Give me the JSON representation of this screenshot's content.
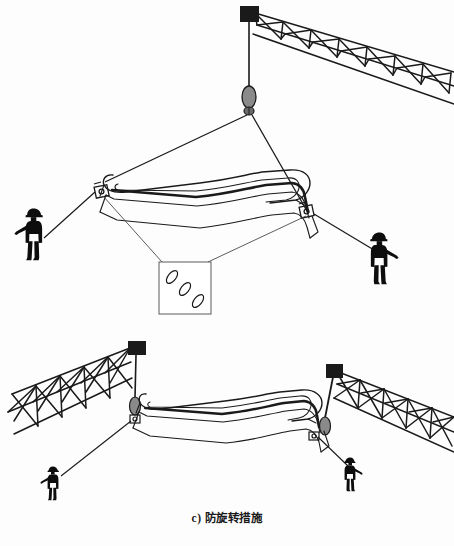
{
  "figure": {
    "caption_label": "c)",
    "caption_text": "防旋转措施",
    "background_color": "#fdfdfd",
    "ink_color": "#1a1a1a",
    "hookblock_color": "#8a8a8a",
    "panel_count": 2
  },
  "panel_top": {
    "name": "single-crane-lift-with-taglines",
    "boom": {
      "label": "lattice-boom",
      "tip_block": "boom-tip-block",
      "chord_count": 3,
      "panel_bays": 7
    },
    "hoist": {
      "rope": "hoist-rope",
      "hook_block": "hook-block",
      "swivel": "anti-rotation-swivel"
    },
    "slings": {
      "left_leg": "sling-leg-left",
      "right_leg": "sling-leg-right"
    },
    "load": {
      "label": "curved-box-girder",
      "shackle_left": "shackle-left",
      "shackle_right": "shackle-right"
    },
    "taglines": {
      "left": "tagline-left",
      "right": "tagline-right"
    },
    "workers": [
      {
        "id": "worker-left",
        "label": "rigger-holding-tagline"
      },
      {
        "id": "worker-right",
        "label": "rigger-holding-tagline"
      }
    ],
    "detail_callout": {
      "label": "chain-detail-callout",
      "link_count": 3,
      "content": "anti-rotation chain links"
    }
  },
  "panel_bottom": {
    "name": "tandem-crane-lift-with-taglines",
    "boom_left": {
      "label": "lattice-boom-left",
      "tip_block": "boom-tip-block-left",
      "panel_bays": 5
    },
    "boom_right": {
      "label": "lattice-boom-right",
      "tip_block": "boom-tip-block-right",
      "panel_bays": 5
    },
    "hoist_left": {
      "rope": "hoist-rope-left",
      "hook_block": "hook-block-left",
      "swivel": "anti-rotation-swivel-left"
    },
    "hoist_right": {
      "rope": "hoist-rope-right",
      "hook_block": "hook-block-right",
      "swivel": "anti-rotation-swivel-right"
    },
    "load": {
      "label": "curved-box-girder",
      "shackle_left": "shackle-left",
      "shackle_right": "shackle-right"
    },
    "taglines": {
      "left": "tagline-left",
      "right": "tagline-right"
    },
    "workers": [
      {
        "id": "worker-left",
        "label": "rigger-holding-tagline"
      },
      {
        "id": "worker-right",
        "label": "rigger-holding-tagline"
      }
    ]
  },
  "scan_artifact": {
    "text": ""
  }
}
